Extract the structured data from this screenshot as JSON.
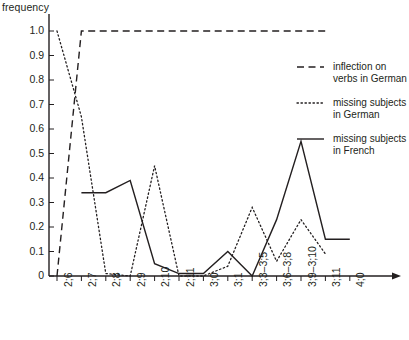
{
  "axes": {
    "y_axis_title": "frequency",
    "y_ticks": [
      "0",
      "0.1",
      "0.2",
      "0.3",
      "0.4",
      "0.5",
      "0.6",
      "0.7",
      "0.8",
      "0.9",
      "1.0"
    ],
    "x_ticks": [
      "2;6",
      "2;7",
      "2;8",
      "2;9",
      "2;10",
      "2;11",
      "3;0",
      "3;1",
      "3;3–3;5",
      "3;6–3;8",
      "3;9–3;10",
      "3;11",
      "4;0"
    ]
  },
  "legend": {
    "position": "right",
    "entries": [
      {
        "label_line1": "inflection on",
        "label_line2": "verbs in German",
        "style": "dashed",
        "color": "#231f20"
      },
      {
        "label_line1": "missing subjects",
        "label_line2": "in German",
        "style": "dotted",
        "color": "#231f20"
      },
      {
        "label_line1": "missing subjects",
        "label_line2": "in French",
        "style": "solid",
        "color": "#231f20"
      }
    ]
  },
  "chart_data": {
    "type": "line",
    "title": "",
    "xlabel": "",
    "ylabel": "frequency",
    "ylim": [
      0,
      1.0
    ],
    "ytick_step": 0.1,
    "grid": false,
    "legend_position": "right",
    "categories": [
      "2;6",
      "2;7",
      "2;8",
      "2;9",
      "2;10",
      "2;11",
      "3;0",
      "3;1",
      "3;3–3;5",
      "3;6–3;8",
      "3;9–3;10",
      "3;11",
      "4;0"
    ],
    "series": [
      {
        "name": "inflection on verbs in German",
        "style": "dashed",
        "color": "#231f20",
        "values": [
          0,
          1.0,
          1.0,
          1.0,
          1.0,
          1.0,
          1.0,
          1.0,
          1.0,
          1.0,
          1.0,
          1.0,
          null
        ]
      },
      {
        "name": "missing subjects in German",
        "style": "dotted",
        "color": "#231f20",
        "values": [
          1.0,
          0.65,
          0.01,
          0,
          0.45,
          0,
          0,
          0.04,
          0.28,
          0.06,
          0.23,
          0.09,
          null
        ]
      },
      {
        "name": "missing subjects in French",
        "style": "solid",
        "color": "#231f20",
        "values": [
          null,
          0.34,
          0.34,
          0.39,
          0.05,
          0.01,
          0.01,
          0.1,
          0,
          0.23,
          0.55,
          0.15,
          0.15
        ]
      }
    ]
  }
}
